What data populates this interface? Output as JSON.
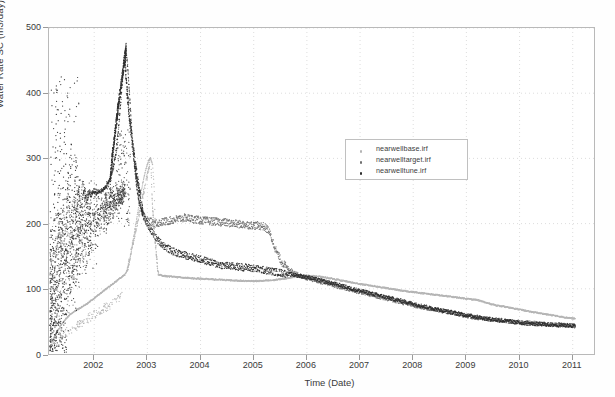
{
  "chart_data": {
    "type": "scatter",
    "title": "",
    "xlabel": "Time (Date)",
    "ylabel": "Water Rate SC (m3/day)",
    "xlim": [
      2001.15,
      2011.4
    ],
    "ylim": [
      0,
      500
    ],
    "xticks": [
      2002,
      2003,
      2004,
      2005,
      2006,
      2007,
      2008,
      2009,
      2010,
      2011
    ],
    "xticklabels": [
      "2002",
      "2003",
      "2004",
      "2005",
      "2006",
      "2007",
      "2008",
      "2009",
      "2010",
      "2011"
    ],
    "yticks": [
      0,
      100,
      200,
      300,
      400,
      500
    ],
    "yticklabels": [
      "0",
      "100",
      "200",
      "300",
      "400",
      "500"
    ],
    "grid": "dotted",
    "legend_position": "upper-center-right",
    "series": [
      {
        "name": "nearwellbase.irf",
        "color": "#b4b4b4",
        "marker": "dot",
        "points": [
          [
            2001.2,
            18
          ],
          [
            2001.25,
            26
          ],
          [
            2001.3,
            34
          ],
          [
            2001.35,
            41
          ],
          [
            2001.4,
            47
          ],
          [
            2001.45,
            52
          ],
          [
            2001.5,
            57
          ],
          [
            2001.55,
            61
          ],
          [
            2001.62,
            65
          ],
          [
            2001.7,
            69
          ],
          [
            2001.78,
            73
          ],
          [
            2001.86,
            77
          ],
          [
            2001.94,
            82
          ],
          [
            2002.02,
            87
          ],
          [
            2002.1,
            92
          ],
          [
            2002.18,
            97
          ],
          [
            2002.26,
            102
          ],
          [
            2002.34,
            107
          ],
          [
            2002.42,
            112
          ],
          [
            2002.5,
            117
          ],
          [
            2002.58,
            122
          ],
          [
            2002.62,
            128
          ],
          [
            2002.66,
            140
          ],
          [
            2002.7,
            158
          ],
          [
            2002.74,
            178
          ],
          [
            2002.78,
            198
          ],
          [
            2002.82,
            218
          ],
          [
            2002.86,
            238
          ],
          [
            2002.9,
            256
          ],
          [
            2002.94,
            272
          ],
          [
            2002.98,
            286
          ],
          [
            2003.02,
            296
          ],
          [
            2003.06,
            301
          ],
          [
            2003.1,
            290
          ],
          [
            2003.13,
            250
          ],
          [
            2003.15,
            190
          ],
          [
            2003.17,
            150
          ],
          [
            2003.19,
            130
          ],
          [
            2003.22,
            122
          ],
          [
            2003.28,
            120
          ],
          [
            2003.4,
            119
          ],
          [
            2003.55,
            118
          ],
          [
            2003.7,
            117
          ],
          [
            2003.9,
            116
          ],
          [
            2004.1,
            115
          ],
          [
            2004.35,
            114
          ],
          [
            2004.6,
            113
          ],
          [
            2004.85,
            112
          ],
          [
            2005.1,
            112
          ],
          [
            2005.35,
            113
          ],
          [
            2005.6,
            116
          ],
          [
            2005.8,
            119
          ],
          [
            2006.0,
            120
          ],
          [
            2006.2,
            119
          ],
          [
            2006.45,
            116
          ],
          [
            2006.7,
            112
          ],
          [
            2006.95,
            108
          ],
          [
            2007.2,
            105
          ],
          [
            2007.5,
            101
          ],
          [
            2007.8,
            97
          ],
          [
            2008.1,
            94
          ],
          [
            2008.4,
            91
          ],
          [
            2008.7,
            88
          ],
          [
            2009.0,
            85
          ],
          [
            2009.2,
            83
          ],
          [
            2009.4,
            78
          ],
          [
            2009.6,
            74
          ],
          [
            2009.9,
            70
          ],
          [
            2010.2,
            65
          ],
          [
            2010.5,
            61
          ],
          [
            2010.8,
            57
          ],
          [
            2011.05,
            54
          ]
        ]
      },
      {
        "name": "nearwelltarget.irf",
        "color": "#707070",
        "marker": "dot",
        "points": [
          [
            2001.18,
            60
          ],
          [
            2001.22,
            95
          ],
          [
            2001.26,
            130
          ],
          [
            2001.3,
            165
          ],
          [
            2001.34,
            200
          ],
          [
            2001.38,
            150
          ],
          [
            2001.42,
            230
          ],
          [
            2001.46,
            185
          ],
          [
            2001.5,
            260
          ],
          [
            2001.54,
            205
          ],
          [
            2001.58,
            175
          ],
          [
            2001.62,
            240
          ],
          [
            2001.66,
            210
          ],
          [
            2001.7,
            255
          ],
          [
            2001.74,
            225
          ],
          [
            2001.78,
            265
          ],
          [
            2001.82,
            235
          ],
          [
            2001.86,
            245
          ],
          [
            2001.9,
            250
          ],
          [
            2001.95,
            248
          ],
          [
            2002.0,
            252
          ],
          [
            2002.06,
            250
          ],
          [
            2002.12,
            248
          ],
          [
            2002.18,
            252
          ],
          [
            2002.24,
            258
          ],
          [
            2002.3,
            268
          ],
          [
            2002.36,
            285
          ],
          [
            2002.42,
            310
          ],
          [
            2002.46,
            345
          ],
          [
            2002.5,
            385
          ],
          [
            2002.54,
            425
          ],
          [
            2002.57,
            455
          ],
          [
            2002.59,
            468
          ],
          [
            2002.61,
            462
          ],
          [
            2002.64,
            430
          ],
          [
            2002.68,
            380
          ],
          [
            2002.72,
            330
          ],
          [
            2002.76,
            290
          ],
          [
            2002.8,
            258
          ],
          [
            2002.84,
            235
          ],
          [
            2002.88,
            222
          ],
          [
            2002.92,
            213
          ],
          [
            2002.96,
            207
          ],
          [
            2003.02,
            203
          ],
          [
            2003.1,
            202
          ],
          [
            2003.2,
            201
          ],
          [
            2003.32,
            203
          ],
          [
            2003.45,
            205
          ],
          [
            2003.58,
            207
          ],
          [
            2003.72,
            209
          ],
          [
            2003.86,
            207
          ],
          [
            2004.0,
            205
          ],
          [
            2004.15,
            204
          ],
          [
            2004.3,
            203
          ],
          [
            2004.45,
            202
          ],
          [
            2004.6,
            200
          ],
          [
            2004.75,
            199
          ],
          [
            2004.9,
            198
          ],
          [
            2005.05,
            197
          ],
          [
            2005.18,
            196
          ],
          [
            2005.28,
            190
          ],
          [
            2005.36,
            172
          ],
          [
            2005.44,
            155
          ],
          [
            2005.52,
            142
          ],
          [
            2005.62,
            133
          ],
          [
            2005.74,
            126
          ],
          [
            2005.88,
            120
          ],
          [
            2006.02,
            116
          ],
          [
            2006.2,
            112
          ],
          [
            2006.4,
            108
          ],
          [
            2006.6,
            103
          ],
          [
            2006.85,
            98
          ],
          [
            2007.1,
            93
          ],
          [
            2007.35,
            88
          ],
          [
            2007.6,
            83
          ],
          [
            2007.85,
            78
          ],
          [
            2008.1,
            73
          ],
          [
            2008.35,
            69
          ],
          [
            2008.6,
            65
          ],
          [
            2008.85,
            61
          ],
          [
            2009.1,
            57
          ],
          [
            2009.4,
            54
          ],
          [
            2009.7,
            51
          ],
          [
            2010.0,
            49
          ],
          [
            2010.3,
            47
          ],
          [
            2010.6,
            45
          ],
          [
            2010.9,
            44
          ],
          [
            2011.05,
            43
          ]
        ]
      },
      {
        "name": "nearwelltune.irf",
        "color": "#2e2e2e",
        "marker": "dot",
        "points": [
          [
            2001.18,
            30
          ],
          [
            2001.21,
            110
          ],
          [
            2001.24,
            175
          ],
          [
            2001.27,
            300
          ],
          [
            2001.3,
            415
          ],
          [
            2001.33,
            205
          ],
          [
            2001.36,
            340
          ],
          [
            2001.39,
            145
          ],
          [
            2001.42,
            260
          ],
          [
            2001.45,
            375
          ],
          [
            2001.48,
            190
          ],
          [
            2001.51,
            285
          ],
          [
            2001.54,
            225
          ],
          [
            2001.57,
            330
          ],
          [
            2001.6,
            170
          ],
          [
            2001.63,
            250
          ],
          [
            2001.66,
            300
          ],
          [
            2001.69,
            215
          ],
          [
            2001.72,
            265
          ],
          [
            2001.75,
            195
          ],
          [
            2001.78,
            240
          ],
          [
            2001.82,
            255
          ],
          [
            2001.86,
            230
          ],
          [
            2001.9,
            248
          ],
          [
            2001.94,
            242
          ],
          [
            2001.98,
            250
          ],
          [
            2002.04,
            246
          ],
          [
            2002.1,
            249
          ],
          [
            2002.16,
            252
          ],
          [
            2002.22,
            256
          ],
          [
            2002.28,
            265
          ],
          [
            2002.34,
            280
          ],
          [
            2002.4,
            305
          ],
          [
            2002.45,
            340
          ],
          [
            2002.49,
            380
          ],
          [
            2002.53,
            420
          ],
          [
            2002.56,
            450
          ],
          [
            2002.58,
            467
          ],
          [
            2002.6,
            465
          ],
          [
            2002.63,
            440
          ],
          [
            2002.67,
            390
          ],
          [
            2002.71,
            338
          ],
          [
            2002.75,
            295
          ],
          [
            2002.79,
            262
          ],
          [
            2002.83,
            240
          ],
          [
            2002.87,
            226
          ],
          [
            2002.91,
            216
          ],
          [
            2002.95,
            208
          ],
          [
            2003.0,
            200
          ],
          [
            2003.08,
            188
          ],
          [
            2003.18,
            176
          ],
          [
            2003.3,
            167
          ],
          [
            2003.42,
            160
          ],
          [
            2003.55,
            155
          ],
          [
            2003.68,
            152
          ],
          [
            2003.8,
            150
          ],
          [
            2003.92,
            147
          ],
          [
            2004.05,
            144
          ],
          [
            2004.18,
            141
          ],
          [
            2004.3,
            138
          ],
          [
            2004.42,
            136
          ],
          [
            2004.55,
            135
          ],
          [
            2004.68,
            134
          ],
          [
            2004.82,
            133
          ],
          [
            2004.95,
            132
          ],
          [
            2005.1,
            130
          ],
          [
            2005.25,
            128
          ],
          [
            2005.4,
            126
          ],
          [
            2005.55,
            124
          ],
          [
            2005.7,
            122
          ],
          [
            2005.85,
            120
          ],
          [
            2006.0,
            118
          ],
          [
            2006.2,
            114
          ],
          [
            2006.4,
            110
          ],
          [
            2006.6,
            106
          ],
          [
            2006.85,
            100
          ],
          [
            2007.1,
            95
          ],
          [
            2007.35,
            90
          ],
          [
            2007.6,
            85
          ],
          [
            2007.85,
            80
          ],
          [
            2008.1,
            75
          ],
          [
            2008.35,
            70
          ],
          [
            2008.6,
            66
          ],
          [
            2008.85,
            62
          ],
          [
            2009.1,
            58
          ],
          [
            2009.4,
            54
          ],
          [
            2009.7,
            51
          ],
          [
            2010.0,
            48
          ],
          [
            2010.3,
            46
          ],
          [
            2010.6,
            45
          ],
          [
            2010.9,
            44
          ],
          [
            2011.05,
            43
          ]
        ]
      }
    ],
    "scatter_cloud": {
      "description": "dense early-time measurement scatter 2001.15-2002.6",
      "color": "#3a3a3a"
    }
  },
  "legend": {
    "items": [
      {
        "label": "nearwellbase.irf",
        "color": "#b4b4b4"
      },
      {
        "label": "nearwelltarget.irf",
        "color": "#707070"
      },
      {
        "label": "nearwelltune.irf",
        "color": "#2e2e2e"
      }
    ]
  }
}
